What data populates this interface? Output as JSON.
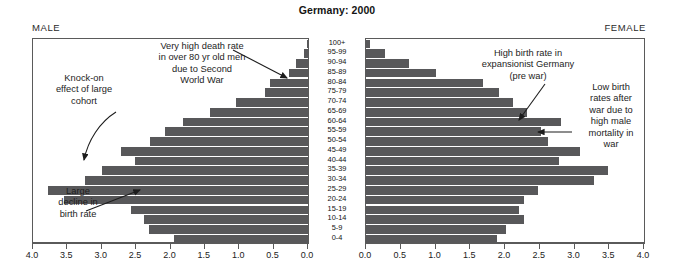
{
  "chart_data": {
    "type": "bar",
    "title": "Germany: 2000",
    "subtype": "population-pyramid",
    "xlabel": "",
    "ylabel": "",
    "xlim": [
      0,
      4.0
    ],
    "grid": false,
    "axis_ticks": [
      "0.0",
      "0.5",
      "1.0",
      "1.5",
      "2.0",
      "2.5",
      "3.0",
      "3.5",
      "4.0"
    ],
    "left_axis_ticks": [
      "4.0",
      "3.5",
      "3.0",
      "2.5",
      "2.0",
      "1.5",
      "1.0",
      "0.5",
      "0.0"
    ],
    "right_axis_ticks": [
      "0.0",
      "0.5",
      "1.0",
      "1.5",
      "2.0",
      "2.5",
      "3.0",
      "3.5",
      "4.0"
    ],
    "categories": [
      "100+",
      "95-99",
      "90-94",
      "85-89",
      "80-84",
      "75-79",
      "70-74",
      "65-69",
      "60-64",
      "55-59",
      "50-54",
      "45-49",
      "40-44",
      "35-39",
      "30-34",
      "25-29",
      "20-24",
      "15-19",
      "10-14",
      "5-9",
      "0-4"
    ],
    "series": [
      {
        "name": "MALE",
        "side": "left",
        "values": [
          0.01,
          0.06,
          0.17,
          0.28,
          0.55,
          0.62,
          1.05,
          1.42,
          1.82,
          2.08,
          2.3,
          2.72,
          2.52,
          3.0,
          3.25,
          3.78,
          3.55,
          2.58,
          2.38,
          2.32,
          1.95
        ]
      },
      {
        "name": "FEMALE",
        "side": "right",
        "values": [
          0.06,
          0.28,
          0.62,
          1.0,
          1.68,
          1.92,
          2.12,
          2.32,
          2.8,
          2.52,
          2.62,
          3.08,
          2.78,
          3.48,
          3.28,
          2.48,
          2.28,
          2.2,
          2.28,
          2.02,
          1.88
        ]
      }
    ],
    "annotations": [
      {
        "id": "war-deaths",
        "text": "Very high death rate\nin over 80 yr old men\ndue to Second\nWorld War",
        "points_to": "male 85-89 / 90-94 bars"
      },
      {
        "id": "knock-on",
        "text": "Knock-on\neffect of large\ncohort",
        "points_to": "male 25-29 bar"
      },
      {
        "id": "birth-decline",
        "text": "Large\ndecline in\nbirth rate",
        "points_to": "male 15-19 bar"
      },
      {
        "id": "high-birth",
        "text": "High birth rate in\nexpansionist Germany\n(pre war)",
        "points_to": "female 60-64 bar"
      },
      {
        "id": "low-birth",
        "text": "Low birth\nrates after\nwar due to\nhigh male\nmortality in\nwar",
        "points_to": "female 55-59 bar"
      }
    ],
    "colors": {
      "bar": "#58585a",
      "axis": "#5a5a5a",
      "text": "#1a1a1a",
      "background": "#ffffff"
    }
  },
  "header": {
    "title": "Germany: 2000",
    "male_label": "MALE",
    "female_label": "FEMALE"
  },
  "annotations": {
    "war_deaths": "Very high death rate\nin over 80 yr old men\ndue to Second\nWorld War",
    "knock_on": "Knock-on\neffect of large\ncohort",
    "birth_decline": "Large\ndecline in\nbirth rate",
    "high_birth": "High birth rate in\nexpansionist Germany\n(pre war)",
    "low_birth": "Low birth\nrates after\nwar due to\nhigh male\nmortality in\nwar"
  }
}
